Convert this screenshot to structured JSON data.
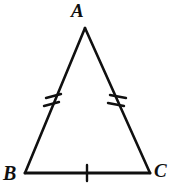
{
  "figure": {
    "kind": "geometry-diagram",
    "shape": "triangle",
    "background_color": "#ffffff",
    "stroke_color": "#101010",
    "labels": {
      "apex": "A",
      "bottom_left": "B",
      "bottom_right": "C"
    },
    "vertices": [
      {
        "name": "A",
        "x": 85,
        "y": 28
      },
      {
        "name": "B",
        "x": 25,
        "y": 173
      },
      {
        "name": "C",
        "x": 150,
        "y": 173
      }
    ],
    "sides": [
      {
        "name": "AB",
        "from": "A",
        "to": "B",
        "tick_marks": 2
      },
      {
        "name": "AC",
        "from": "A",
        "to": "C",
        "tick_marks": 2
      },
      {
        "name": "BC",
        "from": "B",
        "to": "C",
        "tick_marks": 1
      }
    ],
    "congruence_note": "Double ticks on AB and AC mark them congruent; single tick on BC"
  }
}
